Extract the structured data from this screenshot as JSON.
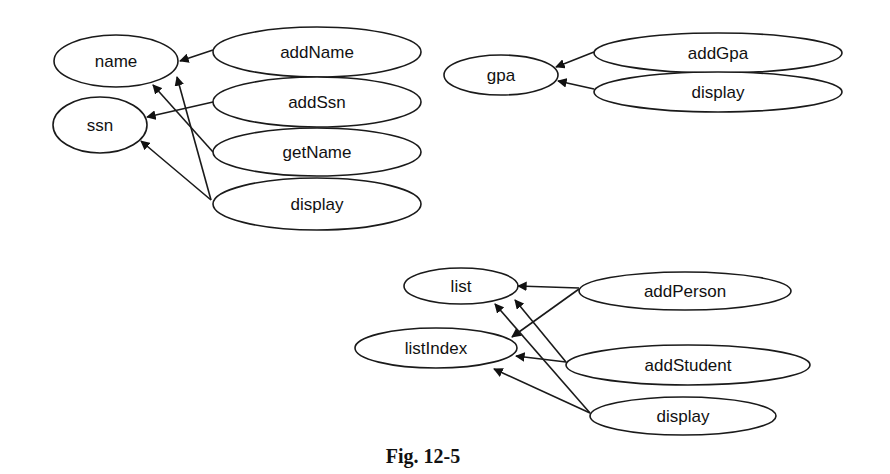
{
  "figure": {
    "caption": "Fig. 12-5",
    "background": "#ffffff",
    "stroke_color": "#1a1a1a"
  },
  "groups": [
    {
      "id": "person",
      "attributes": [
        {
          "id": "name",
          "label": "name",
          "cx": 116,
          "cy": 61,
          "rx": 62,
          "ry": 26
        },
        {
          "id": "ssn",
          "label": "ssn",
          "cx": 100,
          "cy": 125,
          "rx": 47,
          "ry": 28
        }
      ],
      "methods": [
        {
          "id": "addName",
          "label": "addName",
          "cx": 317,
          "cy": 52,
          "rx": 104,
          "ry": 25
        },
        {
          "id": "addSsn",
          "label": "addSsn",
          "cx": 317,
          "cy": 102,
          "rx": 104,
          "ry": 25
        },
        {
          "id": "getName",
          "label": "getName",
          "cx": 317,
          "cy": 152,
          "rx": 104,
          "ry": 24
        },
        {
          "id": "display_person",
          "label": "display",
          "cx": 317,
          "cy": 204,
          "rx": 104,
          "ry": 26
        }
      ],
      "edges": [
        {
          "from": "addName",
          "to": "name",
          "x1": 213,
          "y1": 50,
          "x2": 180,
          "y2": 61
        },
        {
          "from": "addSsn",
          "to": "ssn",
          "x1": 213,
          "y1": 102,
          "x2": 147,
          "y2": 117
        },
        {
          "from": "getName",
          "to": "name",
          "x1": 213,
          "y1": 152,
          "x2": 153,
          "y2": 85
        },
        {
          "from": "display",
          "to": "name",
          "x1": 211,
          "y1": 200,
          "x2": 177,
          "y2": 77
        },
        {
          "from": "display",
          "to": "ssn",
          "x1": 211,
          "y1": 200,
          "x2": 141,
          "y2": 141
        }
      ]
    },
    {
      "id": "student",
      "attributes": [
        {
          "id": "gpa",
          "label": "gpa",
          "cx": 501,
          "cy": 75,
          "rx": 57,
          "ry": 20
        }
      ],
      "methods": [
        {
          "id": "addGpa",
          "label": "addGpa",
          "cx": 718,
          "cy": 53,
          "rx": 124,
          "ry": 20
        },
        {
          "id": "display_student",
          "label": "display",
          "cx": 718,
          "cy": 92,
          "rx": 124,
          "ry": 20
        }
      ],
      "edges": [
        {
          "from": "addGpa",
          "to": "gpa",
          "x1": 594,
          "y1": 52,
          "x2": 556,
          "y2": 67
        },
        {
          "from": "display",
          "to": "gpa",
          "x1": 594,
          "y1": 89,
          "x2": 558,
          "y2": 81
        }
      ]
    },
    {
      "id": "list",
      "attributes": [
        {
          "id": "list",
          "label": "list",
          "cx": 461,
          "cy": 286,
          "rx": 57,
          "ry": 18
        },
        {
          "id": "listIndex",
          "label": "listIndex",
          "cx": 436,
          "cy": 348,
          "rx": 81,
          "ry": 20
        }
      ],
      "methods": [
        {
          "id": "addPerson",
          "label": "addPerson",
          "cx": 685,
          "cy": 291,
          "rx": 106,
          "ry": 19
        },
        {
          "id": "addStudent",
          "label": "addStudent",
          "cx": 688,
          "cy": 365,
          "rx": 122,
          "ry": 20
        },
        {
          "id": "display_list",
          "label": "display",
          "cx": 683,
          "cy": 416,
          "rx": 93,
          "ry": 19
        }
      ],
      "edges": [
        {
          "from": "addPerson",
          "to": "list",
          "x1": 579,
          "y1": 288,
          "x2": 518,
          "y2": 286
        },
        {
          "from": "addPerson",
          "to": "listIndex",
          "x1": 579,
          "y1": 289,
          "x2": 512,
          "y2": 337
        },
        {
          "from": "addStudent",
          "to": "listIndex",
          "x1": 566,
          "y1": 362,
          "x2": 516,
          "y2": 356
        },
        {
          "from": "addStudent",
          "to": "list",
          "x1": 566,
          "y1": 362,
          "x2": 515,
          "y2": 300
        },
        {
          "from": "display",
          "to": "list",
          "x1": 590,
          "y1": 413,
          "x2": 495,
          "y2": 304
        },
        {
          "from": "display",
          "to": "listIndex",
          "x1": 590,
          "y1": 413,
          "x2": 494,
          "y2": 369
        }
      ]
    }
  ]
}
